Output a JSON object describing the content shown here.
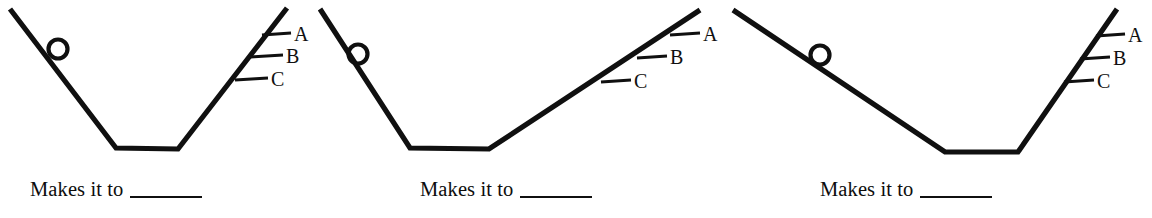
{
  "figure": {
    "type": "physics-worksheet-diagram",
    "stroke_color": "#101010",
    "background_color": "#ffffff",
    "panels": [
      {
        "id": "panel-1",
        "ball": {
          "cx": 58,
          "cy": 49,
          "r": 9.5
        },
        "ramp_points": "10,9 116,148 178,149 287,8",
        "levels": [
          {
            "label": "A",
            "tick_x1": 262,
            "tick_y1": 35,
            "tick_x2": 291,
            "tick_y2": 33,
            "label_x": 294,
            "label_y": 41
          },
          {
            "label": "B",
            "tick_x1": 250,
            "tick_y1": 57,
            "tick_x2": 283,
            "tick_y2": 55,
            "label_x": 286,
            "label_y": 63
          },
          {
            "label": "C",
            "tick_x1": 235,
            "tick_y1": 80,
            "tick_x2": 268,
            "tick_y2": 78,
            "label_x": 271,
            "label_y": 86
          }
        ],
        "caption_text": "Makes it to"
      },
      {
        "id": "panel-2",
        "ball": {
          "cx": 358,
          "cy": 54,
          "r": 9.5
        },
        "ramp_points": "320,9 410,148 489,149 700,10",
        "levels": [
          {
            "label": "A",
            "tick_x1": 670,
            "tick_y1": 35,
            "tick_x2": 700,
            "tick_y2": 33,
            "label_x": 703,
            "label_y": 41
          },
          {
            "label": "B",
            "tick_x1": 637,
            "tick_y1": 58,
            "tick_x2": 667,
            "tick_y2": 56,
            "label_x": 670,
            "label_y": 64
          },
          {
            "label": "C",
            "tick_x1": 601,
            "tick_y1": 82,
            "tick_x2": 631,
            "tick_y2": 80,
            "label_x": 634,
            "label_y": 88
          }
        ],
        "caption_text": "Makes it to"
      },
      {
        "id": "panel-3",
        "ball": {
          "cx": 820,
          "cy": 55,
          "r": 9.5
        },
        "ramp_points": "733,10 945,152 1018,152 1117,9",
        "levels": [
          {
            "label": "A",
            "tick_x1": 1096,
            "tick_y1": 36,
            "tick_x2": 1125,
            "tick_y2": 34,
            "label_x": 1128,
            "label_y": 42
          },
          {
            "label": "B",
            "tick_x1": 1080,
            "tick_y1": 59,
            "tick_x2": 1110,
            "tick_y2": 57,
            "label_x": 1113,
            "label_y": 65
          },
          {
            "label": "C",
            "tick_x1": 1064,
            "tick_y1": 82,
            "tick_x2": 1094,
            "tick_y2": 80,
            "label_x": 1097,
            "label_y": 88
          }
        ],
        "caption_text": "Makes it to"
      }
    ]
  }
}
